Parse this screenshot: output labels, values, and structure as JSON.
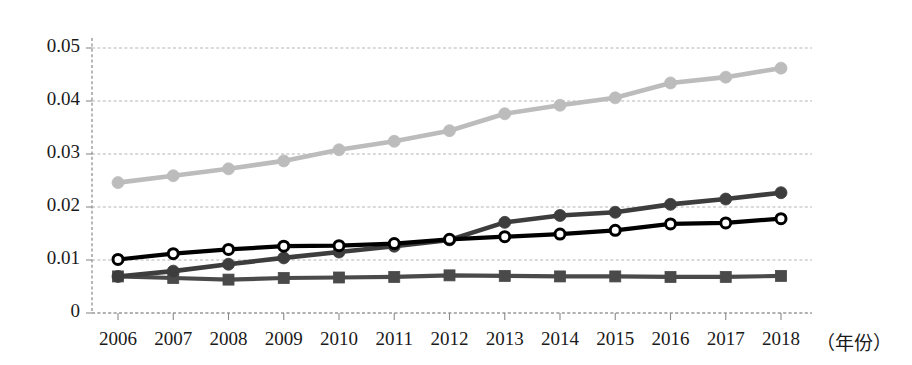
{
  "chart_data": {
    "type": "line",
    "title": "",
    "subtitle": "",
    "xlabel": "（年份）",
    "ylabel": "",
    "x": [
      2006,
      2007,
      2008,
      2009,
      2010,
      2011,
      2012,
      2013,
      2014,
      2015,
      2016,
      2017,
      2018
    ],
    "categories": [
      "2006",
      "2007",
      "2008",
      "2009",
      "2010",
      "2011",
      "2012",
      "2013",
      "2014",
      "2015",
      "2016",
      "2017",
      "2018"
    ],
    "ytick_labels": [
      "0.05",
      "0.04",
      "0.03",
      "0.02",
      "0.01",
      "0"
    ],
    "ytick_values": [
      0.05,
      0.04,
      0.03,
      0.02,
      0.01,
      0
    ],
    "ylim": [
      0,
      0.053
    ],
    "xlim": [
      2006,
      2018
    ],
    "grid": true,
    "grid_style": "dashed-horizontal",
    "legend": "none",
    "legend_position": "none",
    "series": [
      {
        "name": "light-gray-circle-series",
        "color": "#bcbcbc",
        "marker": "filled-circle",
        "values": [
          0.0246,
          0.0259,
          0.0272,
          0.0287,
          0.0308,
          0.0324,
          0.0344,
          0.0376,
          0.0392,
          0.0406,
          0.0434,
          0.0445,
          0.0462
        ]
      },
      {
        "name": "dark-gray-circle-series",
        "color": "#3d3d3d",
        "marker": "filled-circle",
        "values": [
          0.0069,
          0.0079,
          0.0092,
          0.0104,
          0.0115,
          0.0126,
          0.0138,
          0.0171,
          0.0184,
          0.019,
          0.0205,
          0.0215,
          0.0227
        ]
      },
      {
        "name": "black-open-circle-series",
        "color": "#000000",
        "marker": "open-circle",
        "values": [
          0.0101,
          0.0112,
          0.012,
          0.0126,
          0.0127,
          0.0131,
          0.0139,
          0.0144,
          0.0149,
          0.0156,
          0.0168,
          0.017,
          0.0178
        ]
      },
      {
        "name": "dark-gray-square-series",
        "color": "#4a4a4a",
        "marker": "filled-square",
        "values": [
          0.0069,
          0.0066,
          0.0063,
          0.0066,
          0.0067,
          0.0068,
          0.0071,
          0.007,
          0.0069,
          0.0069,
          0.0068,
          0.0068,
          0.007
        ]
      }
    ]
  },
  "axes": {
    "axis_color": "#888888",
    "grid_color": "#b5b5b5",
    "tick_color": "#8a8a8a"
  }
}
